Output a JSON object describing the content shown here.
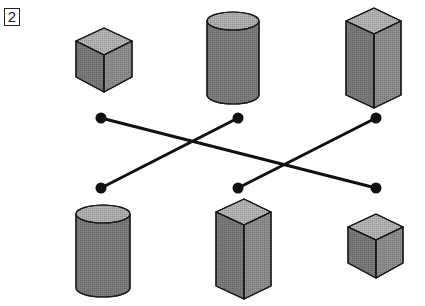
{
  "problem": {
    "number_label": "2"
  },
  "colors": {
    "face_top": "#b4b4b4",
    "face_left": "#7a7a7a",
    "face_right": "#9a9a9a",
    "cyl_body": "#7c7c7c",
    "cyl_top": "#b0b0b0",
    "stroke": "#1a1a1a",
    "line": "#111111"
  },
  "top_row": [
    {
      "shape": "cube"
    },
    {
      "shape": "cylinder"
    },
    {
      "shape": "square-prism"
    }
  ],
  "bottom_row": [
    {
      "shape": "cylinder"
    },
    {
      "shape": "square-prism"
    },
    {
      "shape": "cube"
    }
  ],
  "connections": [
    {
      "from": "top-1",
      "to": "bottom-3"
    },
    {
      "from": "top-2",
      "to": "bottom-1"
    },
    {
      "from": "top-3",
      "to": "bottom-2"
    }
  ]
}
